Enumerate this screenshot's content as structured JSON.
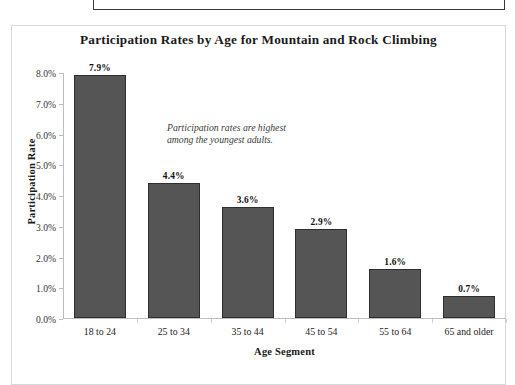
{
  "top_clipped_frame": {},
  "chart_data": {
    "type": "bar",
    "title": "Participation Rates by Age for Mountain and Rock Climbing",
    "xlabel": "Age Segment",
    "ylabel": "Participation Rate",
    "categories": [
      "18 to 24",
      "25 to 34",
      "35 to 44",
      "45 to 54",
      "55 to 64",
      "65 and older"
    ],
    "values": [
      7.9,
      4.4,
      3.6,
      2.9,
      1.6,
      0.7
    ],
    "value_labels": [
      "7.9%",
      "4.4%",
      "3.6%",
      "2.9%",
      "1.6%",
      "0.7%"
    ],
    "ylim": [
      0,
      8
    ],
    "ytick_labels": [
      "0.0%",
      "1.0%",
      "2.0%",
      "3.0%",
      "4.0%",
      "5.0%",
      "6.0%",
      "7.0%",
      "8.0%"
    ],
    "ytick_values": [
      0,
      1,
      2,
      3,
      4,
      5,
      6,
      7,
      8
    ],
    "grid": false,
    "legend": "none",
    "bar_color": "#555555",
    "bar_border_color": "#2e2e2e",
    "annotation": "Participation rates are highest\namong the youngest adults."
  }
}
